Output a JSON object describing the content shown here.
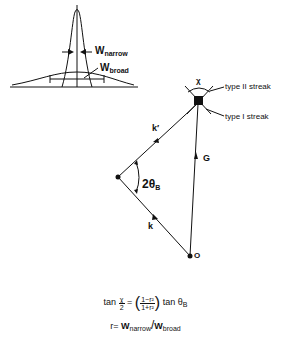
{
  "peak_diagram": {
    "w_narrow": {
      "base": "W",
      "sub": "narrow"
    },
    "w_broad": {
      "base": "W",
      "sub": "broad"
    }
  },
  "vector_diagram": {
    "streak_labels": {
      "chi": "χ",
      "type2": "type II streak",
      "type1": "type I streak"
    },
    "vectors": {
      "k_prime": "k′",
      "k": "k",
      "G": "G"
    },
    "angle": {
      "base": "2θ",
      "sub": "B"
    },
    "origin_label": "O"
  },
  "formulas": {
    "line1": {
      "tan": "tan",
      "chi_num": "χ",
      "chi_den": "2",
      "eq": "=",
      "frac_num": "1−r²",
      "frac_den": "1+r²",
      "tan2": "tan",
      "theta": "θ",
      "theta_sub": "B"
    },
    "line2": {
      "lhs": "r=",
      "w1": "W",
      "w1_sub": "narrow",
      "slash": "/",
      "w2": "W",
      "w2_sub": "broad"
    }
  }
}
